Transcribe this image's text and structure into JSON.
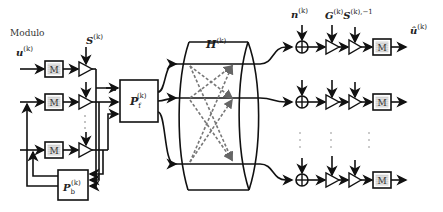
{
  "diagram": {
    "title_label": "Modulo",
    "labels": {
      "input": "u",
      "input_sup": "(k)",
      "scaling": "S",
      "scaling_sup": "(k)",
      "feedforward": "P",
      "feedforward_sub": "f",
      "feedforward_sup": "(k)",
      "feedback": "P",
      "feedback_sub": "b",
      "feedback_sup": "(k)",
      "channel": "H",
      "channel_sup": "(k)",
      "noise": "n",
      "noise_sup": "(k)",
      "receiver_gain": "G",
      "receiver_gain_sup": "(k)",
      "inverse_scaling": "S",
      "inverse_scaling_sup": "(k),−1",
      "output": "û",
      "output_sup": "(k)"
    },
    "modulo_block_text": "M",
    "ellipsis": "⋮"
  }
}
